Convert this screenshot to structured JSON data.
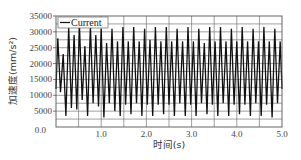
{
  "chart_data": {
    "type": "line",
    "title": "",
    "xlabel": "时间(s)",
    "ylabel": "加速度(mm/s²)",
    "xlim": [
      0.0,
      5.0
    ],
    "ylim": [
      0,
      35000
    ],
    "x_ticks": [
      "0.0",
      "1.0",
      "2.0",
      "3.0",
      "4.0",
      "5.0"
    ],
    "y_ticks": [
      "5000",
      "10000",
      "15000",
      "20000",
      "25000",
      "30000",
      "35000"
    ],
    "y_zero_label": "0.0",
    "grid": true,
    "x_grid_step": 0.5,
    "y_grid_step": 5000,
    "legend": {
      "position": "upper-left",
      "entries": [
        "Current"
      ]
    },
    "series": [
      {
        "name": "Current",
        "color": "#111111",
        "x": [
          0.0,
          0.04,
          0.1,
          0.16,
          0.22,
          0.28,
          0.34,
          0.4,
          0.46,
          0.52,
          0.58,
          0.64,
          0.7,
          0.76,
          0.82,
          0.88,
          0.94,
          1.0,
          1.06,
          1.12,
          1.18,
          1.24,
          1.3,
          1.36,
          1.42,
          1.48,
          1.54,
          1.6,
          1.66,
          1.72,
          1.78,
          1.84,
          1.9,
          1.96,
          2.02,
          2.08,
          2.14,
          2.2,
          2.26,
          2.32,
          2.38,
          2.44,
          2.5,
          2.56,
          2.62,
          2.68,
          2.74,
          2.8,
          2.86,
          2.92,
          2.98,
          3.04,
          3.1,
          3.16,
          3.22,
          3.28,
          3.34,
          3.4,
          3.46,
          3.52,
          3.58,
          3.64,
          3.7,
          3.76,
          3.82,
          3.88,
          3.94,
          4.0,
          4.06,
          4.12,
          4.18,
          4.24,
          4.3,
          4.36,
          4.42,
          4.48,
          4.54,
          4.6,
          4.66,
          4.72,
          4.78,
          4.84,
          4.9,
          4.96,
          5.0
        ],
        "values": [
          12000,
          28000,
          11000,
          23000,
          3500,
          31500,
          6000,
          29000,
          5500,
          31500,
          8500,
          25500,
          3500,
          32000,
          7500,
          29000,
          6500,
          31000,
          3000,
          26500,
          7500,
          31000,
          5000,
          27000,
          3500,
          31500,
          7000,
          27000,
          4000,
          31500,
          7500,
          27000,
          3500,
          31000,
          7000,
          27500,
          3500,
          31500,
          7000,
          27000,
          4000,
          31500,
          7000,
          27000,
          3500,
          31000,
          7500,
          27000,
          3500,
          31500,
          7000,
          27000,
          3500,
          31000,
          7500,
          26500,
          4000,
          31500,
          7000,
          27000,
          3500,
          31500,
          7500,
          27000,
          3500,
          31000,
          7000,
          27000,
          4000,
          31500,
          7000,
          27000,
          3500,
          31000,
          7500,
          27000,
          3500,
          31500,
          7000,
          27000,
          3000,
          31000,
          7500,
          27000,
          12000
        ]
      }
    ]
  }
}
